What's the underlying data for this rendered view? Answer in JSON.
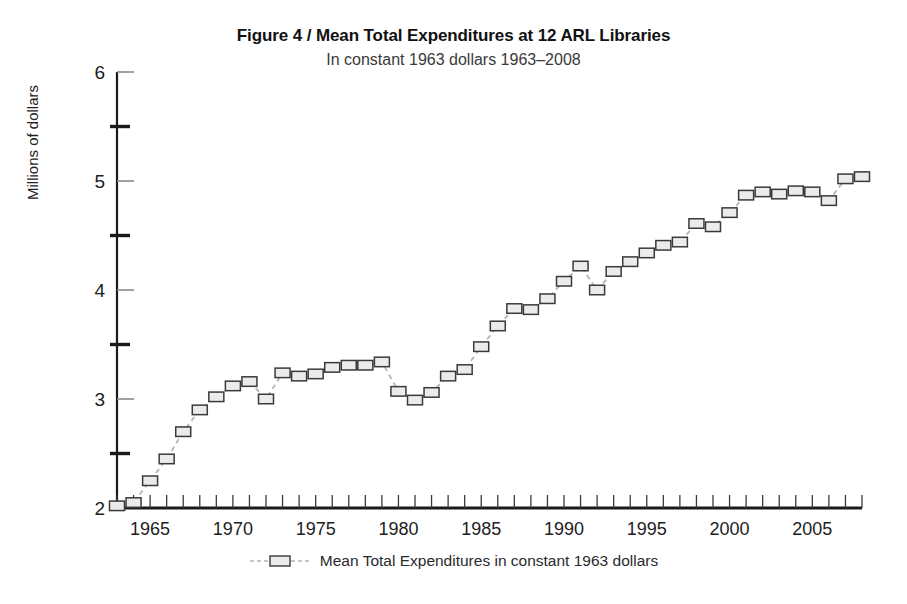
{
  "figure": {
    "title": "Figure 4  /  Mean Total Expenditures at 12 ARL Libraries",
    "subtitle": "In constant 1963 dollars 1963–2008",
    "legend_label": "Mean Total Expenditures in constant 1963 dollars",
    "ylabel": "Millions of dollars"
  },
  "colors": {
    "axis": "#1a1a1a",
    "marker_fill": "#ebebeb",
    "marker_stroke": "#3a3a3a",
    "line": "#b4b4b4",
    "text": "#1a1a1a",
    "subtitle_text": "#3a3a3a"
  },
  "chart_data": {
    "type": "line",
    "title": "Figure 4  /  Mean Total Expenditures at 12 ARL Libraries",
    "subtitle": "In constant 1963 dollars 1963–2008",
    "xlabel": "",
    "ylabel": "Millions of dollars",
    "xlim": [
      1963,
      2008
    ],
    "ylim": [
      2,
      6
    ],
    "xticks": [
      1965,
      1970,
      1975,
      1980,
      1985,
      1990,
      1995,
      2000,
      2005
    ],
    "xtick_labels": [
      "1965",
      "1970",
      "1975",
      "1980",
      "1985",
      "1990",
      "1995",
      "2000",
      "2005"
    ],
    "x_minor_tick_interval": 1,
    "yticks": [
      2,
      3,
      4,
      5,
      6
    ],
    "ytick_labels": [
      "2",
      "3",
      "4",
      "5",
      "6"
    ],
    "y_minor_ticks": [
      2.5,
      3.5,
      4.5,
      5.5
    ],
    "grid": false,
    "legend_position": "bottom-center",
    "marker": "square",
    "linestyle": "dashed",
    "series": [
      {
        "name": "Mean Total Expenditures in constant 1963 dollars",
        "x": [
          1963,
          1964,
          1965,
          1966,
          1967,
          1968,
          1969,
          1970,
          1971,
          1972,
          1973,
          1974,
          1975,
          1976,
          1977,
          1978,
          1979,
          1980,
          1981,
          1982,
          1983,
          1984,
          1985,
          1986,
          1987,
          1988,
          1989,
          1990,
          1991,
          1992,
          1993,
          1994,
          1995,
          1996,
          1997,
          1998,
          1999,
          2000,
          2001,
          2002,
          2003,
          2004,
          2005,
          2006,
          2007,
          2008
        ],
        "values": [
          2.02,
          2.05,
          2.25,
          2.45,
          2.7,
          2.9,
          3.02,
          3.12,
          3.16,
          3.0,
          3.24,
          3.21,
          3.23,
          3.29,
          3.31,
          3.31,
          3.34,
          3.07,
          2.99,
          3.06,
          3.21,
          3.27,
          3.48,
          3.67,
          3.83,
          3.82,
          3.92,
          4.08,
          4.22,
          4.0,
          4.17,
          4.26,
          4.34,
          4.41,
          4.44,
          4.61,
          4.58,
          4.71,
          4.87,
          4.9,
          4.88,
          4.91,
          4.9,
          4.82,
          5.02,
          5.04
        ]
      }
    ]
  }
}
